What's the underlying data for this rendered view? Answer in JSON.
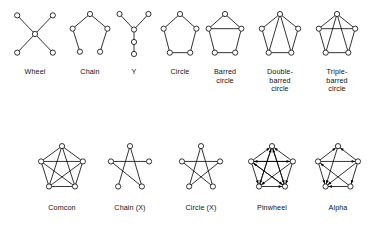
{
  "figure": {
    "type": "diagram",
    "node_count_per_graph": 5,
    "style": {
      "node_fill": "#ffffff",
      "node_stroke": "#000000",
      "edge_color": "#000000",
      "background": "#ffffff",
      "node_radius": 2.6,
      "edge_width": 0.8
    },
    "rows": [
      {
        "row_index": 0,
        "graphs": [
          {
            "id": "wheel",
            "label": "Wheel",
            "label_lines": [
              "Wheel"
            ],
            "directed": false,
            "layout": "star-4-spoke",
            "nodes": [
              {
                "id": 0,
                "x": 50,
                "y": 50
              },
              {
                "id": 1,
                "x": 8,
                "y": 8
              },
              {
                "id": 2,
                "x": 92,
                "y": 8
              },
              {
                "id": 3,
                "x": 8,
                "y": 92
              },
              {
                "id": 4,
                "x": 92,
                "y": 92
              }
            ],
            "edges": [
              [
                0,
                1
              ],
              [
                0,
                2
              ],
              [
                0,
                3
              ],
              [
                0,
                4
              ]
            ]
          },
          {
            "id": "chain",
            "label": "Chain",
            "label_lines": [
              "Chain"
            ],
            "directed": false,
            "layout": "pentagon-open",
            "nodes": [
              {
                "id": 0,
                "x": 50,
                "y": 5
              },
              {
                "id": 1,
                "x": 7,
                "y": 38
              },
              {
                "id": 2,
                "x": 93,
                "y": 38
              },
              {
                "id": 3,
                "x": 25,
                "y": 90
              },
              {
                "id": 4,
                "x": 75,
                "y": 90
              }
            ],
            "edges": [
              [
                3,
                1
              ],
              [
                1,
                0
              ],
              [
                0,
                2
              ],
              [
                2,
                4
              ]
            ]
          },
          {
            "id": "y",
            "label": "Y",
            "label_lines": [
              "Y"
            ],
            "directed": false,
            "layout": "y-branch",
            "nodes": [
              {
                "id": 0,
                "x": 8,
                "y": 5
              },
              {
                "id": 1,
                "x": 92,
                "y": 5
              },
              {
                "id": 2,
                "x": 50,
                "y": 40
              },
              {
                "id": 3,
                "x": 50,
                "y": 68
              },
              {
                "id": 4,
                "x": 50,
                "y": 95
              }
            ],
            "edges": [
              [
                0,
                2
              ],
              [
                1,
                2
              ],
              [
                2,
                3
              ],
              [
                3,
                4
              ]
            ]
          },
          {
            "id": "circle",
            "label": "Circle",
            "label_lines": [
              "Circle"
            ],
            "directed": false,
            "layout": "pentagon",
            "nodes": [
              {
                "id": 0,
                "x": 50,
                "y": 5
              },
              {
                "id": 1,
                "x": 5,
                "y": 38
              },
              {
                "id": 2,
                "x": 95,
                "y": 38
              },
              {
                "id": 3,
                "x": 22,
                "y": 92
              },
              {
                "id": 4,
                "x": 78,
                "y": 92
              }
            ],
            "edges": [
              [
                0,
                1
              ],
              [
                0,
                2
              ],
              [
                1,
                3
              ],
              [
                2,
                4
              ],
              [
                3,
                4
              ]
            ]
          },
          {
            "id": "barred-circle",
            "label": "Barred circle",
            "label_lines": [
              "Barred",
              "circle"
            ],
            "directed": false,
            "layout": "pentagon-plus-bar",
            "nodes": [
              {
                "id": 0,
                "x": 50,
                "y": 5
              },
              {
                "id": 1,
                "x": 5,
                "y": 38
              },
              {
                "id": 2,
                "x": 95,
                "y": 38
              },
              {
                "id": 3,
                "x": 22,
                "y": 92
              },
              {
                "id": 4,
                "x": 78,
                "y": 92
              }
            ],
            "edges": [
              [
                0,
                1
              ],
              [
                0,
                2
              ],
              [
                1,
                3
              ],
              [
                2,
                4
              ],
              [
                3,
                4
              ],
              [
                1,
                2
              ]
            ]
          },
          {
            "id": "double-barred-circle",
            "label": "Double-barred circle",
            "label_lines": [
              "Double-",
              "barred",
              "circle"
            ],
            "directed": false,
            "layout": "pentagon-plus-two-diagonals",
            "nodes": [
              {
                "id": 0,
                "x": 50,
                "y": 5
              },
              {
                "id": 1,
                "x": 5,
                "y": 38
              },
              {
                "id": 2,
                "x": 95,
                "y": 38
              },
              {
                "id": 3,
                "x": 22,
                "y": 92
              },
              {
                "id": 4,
                "x": 78,
                "y": 92
              }
            ],
            "edges": [
              [
                0,
                1
              ],
              [
                0,
                2
              ],
              [
                1,
                3
              ],
              [
                2,
                4
              ],
              [
                3,
                4
              ],
              [
                0,
                3
              ],
              [
                0,
                4
              ]
            ]
          },
          {
            "id": "triple-barred-circle",
            "label": "Triple-barred circle",
            "label_lines": [
              "Triple-",
              "barred",
              "circle"
            ],
            "directed": false,
            "layout": "pentagon-plus-bar-plus-two-diagonals",
            "nodes": [
              {
                "id": 0,
                "x": 50,
                "y": 5
              },
              {
                "id": 1,
                "x": 5,
                "y": 38
              },
              {
                "id": 2,
                "x": 95,
                "y": 38
              },
              {
                "id": 3,
                "x": 22,
                "y": 92
              },
              {
                "id": 4,
                "x": 78,
                "y": 92
              }
            ],
            "edges": [
              [
                0,
                1
              ],
              [
                0,
                2
              ],
              [
                1,
                3
              ],
              [
                2,
                4
              ],
              [
                3,
                4
              ],
              [
                1,
                2
              ],
              [
                0,
                3
              ],
              [
                0,
                4
              ]
            ]
          }
        ]
      },
      {
        "row_index": 1,
        "graphs": [
          {
            "id": "comcon",
            "label": "Comcon",
            "label_lines": [
              "Comcon"
            ],
            "directed": false,
            "layout": "complete-k5",
            "nodes": [
              {
                "id": 0,
                "x": 50,
                "y": 5
              },
              {
                "id": 1,
                "x": 5,
                "y": 38
              },
              {
                "id": 2,
                "x": 95,
                "y": 38
              },
              {
                "id": 3,
                "x": 22,
                "y": 92
              },
              {
                "id": 4,
                "x": 78,
                "y": 92
              }
            ],
            "edges": [
              [
                0,
                1
              ],
              [
                0,
                2
              ],
              [
                1,
                3
              ],
              [
                2,
                4
              ],
              [
                3,
                4
              ],
              [
                1,
                2
              ],
              [
                0,
                3
              ],
              [
                0,
                4
              ],
              [
                1,
                4
              ],
              [
                2,
                3
              ]
            ]
          },
          {
            "id": "chain-x",
            "label": "Chain (X)",
            "label_lines": [
              "Chain (X)"
            ],
            "directed": false,
            "layout": "open-pentagram",
            "nodes": [
              {
                "id": 0,
                "x": 50,
                "y": 5
              },
              {
                "id": 1,
                "x": 5,
                "y": 38
              },
              {
                "id": 2,
                "x": 95,
                "y": 38
              },
              {
                "id": 3,
                "x": 22,
                "y": 92
              },
              {
                "id": 4,
                "x": 78,
                "y": 92
              }
            ],
            "edges": [
              [
                1,
                2
              ],
              [
                0,
                3
              ],
              [
                0,
                4
              ],
              [
                1,
                4
              ]
            ]
          },
          {
            "id": "circle-x",
            "label": "Circle (X)",
            "label_lines": [
              "Circle (X)"
            ],
            "directed": false,
            "layout": "pentagram",
            "nodes": [
              {
                "id": 0,
                "x": 50,
                "y": 5
              },
              {
                "id": 1,
                "x": 5,
                "y": 38
              },
              {
                "id": 2,
                "x": 95,
                "y": 38
              },
              {
                "id": 3,
                "x": 22,
                "y": 92
              },
              {
                "id": 4,
                "x": 78,
                "y": 92
              }
            ],
            "edges": [
              [
                1,
                2
              ],
              [
                0,
                3
              ],
              [
                0,
                4
              ],
              [
                1,
                4
              ],
              [
                2,
                3
              ]
            ]
          },
          {
            "id": "pinwheel",
            "label": "Pinwheel",
            "label_lines": [
              "Pinwheel"
            ],
            "directed": true,
            "layout": "directed-k5-pinwheel",
            "nodes": [
              {
                "id": 0,
                "x": 50,
                "y": 5
              },
              {
                "id": 1,
                "x": 5,
                "y": 38
              },
              {
                "id": 2,
                "x": 95,
                "y": 38
              },
              {
                "id": 3,
                "x": 22,
                "y": 92
              },
              {
                "id": 4,
                "x": 78,
                "y": 92
              }
            ],
            "arcs": [
              [
                1,
                0
              ],
              [
                2,
                0
              ],
              [
                3,
                0
              ],
              [
                4,
                0
              ],
              [
                0,
                3
              ],
              [
                0,
                4
              ],
              [
                2,
                1
              ],
              [
                4,
                1
              ],
              [
                1,
                3
              ],
              [
                2,
                4
              ],
              [
                1,
                2
              ],
              [
                3,
                4
              ],
              [
                2,
                3
              ],
              [
                1,
                4
              ]
            ]
          },
          {
            "id": "alpha",
            "label": "Alpha",
            "label_lines": [
              "Alpha"
            ],
            "directed": true,
            "layout": "directed-k5-alpha",
            "nodes": [
              {
                "id": 0,
                "x": 50,
                "y": 5
              },
              {
                "id": 1,
                "x": 5,
                "y": 38
              },
              {
                "id": 2,
                "x": 95,
                "y": 38
              },
              {
                "id": 3,
                "x": 22,
                "y": 92
              },
              {
                "id": 4,
                "x": 78,
                "y": 92
              }
            ],
            "arcs": [
              [
                1,
                0
              ],
              [
                2,
                0
              ],
              [
                0,
                3
              ],
              [
                1,
                2
              ],
              [
                1,
                3
              ],
              [
                4,
                3
              ],
              [
                2,
                4
              ],
              [
                4,
                1
              ],
              [
                2,
                3
              ]
            ]
          }
        ]
      }
    ]
  }
}
